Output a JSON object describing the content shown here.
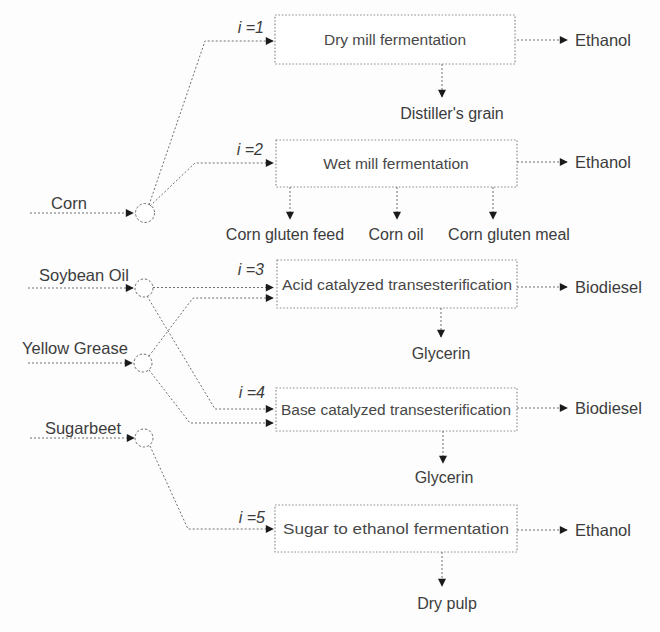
{
  "diagram": {
    "feedstocks": [
      {
        "label": "Corn"
      },
      {
        "label": "Soybean Oil"
      },
      {
        "label": "Yellow Grease"
      },
      {
        "label": "Sugarbeet"
      }
    ],
    "processes": [
      {
        "index_label": "i =1",
        "name": "Dry mill fermentation",
        "product": "Ethanol",
        "byproducts": [
          "Distiller's grain"
        ]
      },
      {
        "index_label": "i =2",
        "name": "Wet mill fermentation",
        "product": "Ethanol",
        "byproducts": [
          "Corn gluten feed",
          "Corn oil",
          "Corn gluten meal"
        ]
      },
      {
        "index_label": "i =3",
        "name": "Acid catalyzed transesterification",
        "product": "Biodiesel",
        "byproducts": [
          "Glycerin"
        ]
      },
      {
        "index_label": "i =4",
        "name": "Base catalyzed transesterification",
        "product": "Biodiesel",
        "byproducts": [
          "Glycerin"
        ]
      },
      {
        "index_label": "i =5",
        "name": "Sugar to ethanol fermentation",
        "product": "Ethanol",
        "byproducts": [
          "Dry pulp"
        ]
      }
    ],
    "colors": {
      "background": "#fdfdfd",
      "line": "#6f6f6f",
      "box_border": "#8f8f8f",
      "text": "#3c3c3c",
      "arrowhead": "#1a1a1a"
    }
  }
}
